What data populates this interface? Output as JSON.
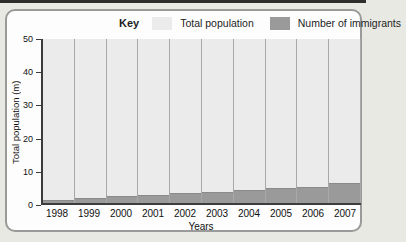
{
  "legend": {
    "key_label": "Key",
    "items": [
      {
        "label": "Total population",
        "color": "#ebebeb"
      },
      {
        "label": "Number of immigrants",
        "color": "#9a9a9a"
      }
    ]
  },
  "chart_data": {
    "type": "bar",
    "stacked": true,
    "title": "",
    "categories": [
      "1998",
      "1999",
      "2000",
      "2001",
      "2002",
      "2003",
      "2004",
      "2005",
      "2006",
      "2007"
    ],
    "series": [
      {
        "name": "Total population",
        "color": "#ebebeb",
        "values": [
          50,
          50,
          50,
          50,
          50,
          50,
          50,
          50,
          50,
          50
        ]
      },
      {
        "name": "Number of immigrants",
        "color": "#9a9a9a",
        "values": [
          1,
          1.5,
          2,
          2.5,
          3,
          3.5,
          4,
          4.5,
          5,
          6
        ]
      }
    ],
    "xlabel": "Years",
    "ylabel": "Total population (m)",
    "ylim": [
      0,
      50
    ],
    "yticks": [
      0,
      10,
      20,
      30,
      40,
      50
    ],
    "grid": false,
    "legend_position": "top"
  },
  "colors": {
    "page_background": "#e9e9e4",
    "top_edge": "#2e2e2e",
    "card_background": "#fdfdfd",
    "card_border": "#9a9a9a",
    "axis": "#3c3c3c",
    "bar_separator": "#a8a8a8",
    "text": "#1e1e1e"
  }
}
